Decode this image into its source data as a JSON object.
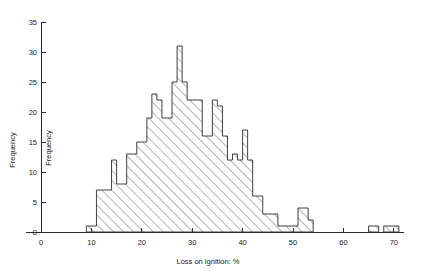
{
  "chart_data": {
    "type": "bar",
    "title": "",
    "subtitle": "",
    "xlabel": "Loss on ignition: %",
    "ylabel": "Frequency",
    "ylabel_secondary": "Frequency",
    "xlim": [
      0,
      71
    ],
    "ylim": [
      0,
      35
    ],
    "xticks": [
      0,
      10,
      20,
      30,
      40,
      50,
      60,
      70
    ],
    "xtick_labels": [
      "0",
      "10",
      "20",
      "30",
      "40",
      "50",
      "60",
      "70"
    ],
    "yticks": [
      0,
      5,
      10,
      15,
      20,
      25,
      30,
      35
    ],
    "ytick_labels": [
      "0",
      "5",
      "10",
      "15",
      "20",
      "25",
      "30",
      "35"
    ],
    "grid": false,
    "legend": null,
    "bin_width": 1,
    "bar_style": "diagonal-hatch",
    "categories": [
      "9",
      "10",
      "11",
      "12",
      "13",
      "14",
      "15",
      "16",
      "17",
      "18",
      "19",
      "20",
      "21",
      "22",
      "23",
      "24",
      "25",
      "26",
      "27",
      "28",
      "29",
      "30",
      "31",
      "32",
      "33",
      "34",
      "35",
      "36",
      "37",
      "38",
      "39",
      "40",
      "41",
      "42",
      "43",
      "44",
      "45",
      "46",
      "47",
      "48",
      "49",
      "50",
      "51",
      "52",
      "53",
      "54",
      "55",
      "56",
      "57",
      "58",
      "59",
      "60",
      "61",
      "62",
      "63",
      "64",
      "65",
      "66",
      "67",
      "68",
      "69",
      "70"
    ],
    "values": [
      1,
      1,
      7,
      7,
      7,
      12,
      8,
      8,
      13,
      13,
      15,
      15,
      19,
      23,
      22,
      19,
      19,
      25,
      31,
      25,
      22,
      22,
      22,
      16,
      16,
      22,
      21,
      16,
      12,
      13,
      12,
      17,
      12,
      6,
      6,
      3,
      3,
      3,
      1,
      1,
      1,
      1,
      4,
      4,
      2,
      0,
      0,
      0,
      0,
      0,
      0,
      0,
      0,
      0,
      0,
      0,
      1,
      1,
      0,
      1,
      1,
      1
    ]
  },
  "axes": {
    "x_axis_label": "Loss on ignition: %",
    "y_axis_label_left": "Frequency",
    "y_axis_label_inner": "Frequency"
  }
}
